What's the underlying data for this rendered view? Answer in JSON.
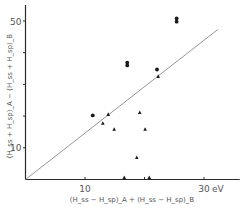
{
  "chart_data": {
    "type": "scatter",
    "title": "",
    "xlabel": "(H_ss − H_sp)_A + (H_ss − H_sp)_B",
    "ylabel": "(H_ss + H_sp)_A − (H_ss + H_sp)_B",
    "x_unit_label": "eV",
    "xlim": [
      0,
      36
    ],
    "ylim": [
      0,
      56
    ],
    "x_ticks": [
      {
        "value": 10,
        "label": "10"
      },
      {
        "value": 20,
        "label": ""
      },
      {
        "value": 30,
        "label": "30"
      }
    ],
    "y_ticks": [
      {
        "value": 10,
        "label": "10"
      },
      {
        "value": 20,
        "label": ""
      },
      {
        "value": 30,
        "label": ""
      },
      {
        "value": 40,
        "label": ""
      },
      {
        "value": 50,
        "label": "50"
      }
    ],
    "grid": false,
    "series": [
      {
        "name": "circles",
        "marker": "circle",
        "points": [
          [
            25.4,
            50.8
          ],
          [
            25.4,
            49.8
          ],
          [
            17.1,
            36.9
          ],
          [
            17.1,
            36.0
          ],
          [
            22.1,
            34.7
          ],
          [
            11.3,
            20.2
          ]
        ]
      },
      {
        "name": "triangles",
        "marker": "triangle",
        "points": [
          [
            22.3,
            32.5
          ],
          [
            13.9,
            20.5
          ],
          [
            13.0,
            17.7
          ],
          [
            14.9,
            15.8
          ],
          [
            19.2,
            21.1
          ],
          [
            20.1,
            15.8
          ],
          [
            18.7,
            6.9
          ],
          [
            16.6,
            0.6
          ],
          [
            20.8,
            0.6
          ]
        ]
      }
    ],
    "reference_line": {
      "from": [
        0,
        0
      ],
      "to": [
        32.3,
        47.3
      ]
    }
  }
}
